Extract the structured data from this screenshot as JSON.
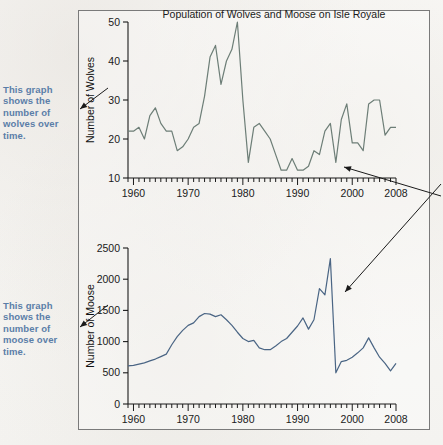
{
  "figure": {
    "title": "Population of Wolves and Moose on Isle Royale",
    "colors": {
      "wolves_line": "#6d7e77",
      "moose_line": "#4a6584",
      "callout_text": "#5b7ea8",
      "frame": "#7a7a7a",
      "axis": "#1a1a1a",
      "page_bg": "#f7f6f4"
    }
  },
  "callouts": {
    "wolves": "This graph shows the number of wolves over time.",
    "moose": "This graph shows the number of moose over time."
  },
  "chart_data": [
    {
      "type": "line",
      "id": "wolves",
      "title": "Population of Wolves and Moose on Isle Royale",
      "xlabel": "",
      "ylabel": "Number of Wolves",
      "xlim": [
        1959,
        2008
      ],
      "ylim": [
        10,
        50
      ],
      "ytick_values": [
        10,
        20,
        30,
        40,
        50
      ],
      "ytick_labels": [
        "10",
        "20",
        "30",
        "40",
        "50"
      ],
      "xtick_values": [
        1960,
        1970,
        1980,
        1990,
        2000,
        2008
      ],
      "xtick_labels": [
        "1960",
        "1970",
        "1980",
        "1990",
        "2000",
        "2008"
      ],
      "minor_xticks_every": 1,
      "grid": false,
      "legend": "none",
      "x": [
        1959,
        1960,
        1961,
        1962,
        1963,
        1964,
        1965,
        1966,
        1967,
        1968,
        1969,
        1970,
        1971,
        1972,
        1973,
        1974,
        1975,
        1976,
        1977,
        1978,
        1979,
        1980,
        1981,
        1982,
        1983,
        1984,
        1985,
        1986,
        1987,
        1988,
        1989,
        1990,
        1991,
        1992,
        1993,
        1994,
        1995,
        1996,
        1997,
        1998,
        1999,
        2000,
        2001,
        2002,
        2003,
        2004,
        2005,
        2006,
        2007,
        2008
      ],
      "values": [
        22,
        22,
        23,
        20,
        26,
        28,
        24,
        22,
        22,
        17,
        18,
        20,
        23,
        24,
        31,
        41,
        44,
        34,
        40,
        43,
        50,
        30,
        14,
        23,
        24,
        22,
        20,
        16,
        12,
        12,
        15,
        12,
        12,
        13,
        17,
        16,
        22,
        24,
        14,
        25,
        29,
        19,
        19,
        17,
        29,
        30,
        30,
        21,
        23,
        23
      ]
    },
    {
      "type": "line",
      "id": "moose",
      "title": "",
      "xlabel": "",
      "ylabel": "Number of Moose",
      "xlim": [
        1959,
        2008
      ],
      "ylim": [
        0,
        2500
      ],
      "ytick_values": [
        0,
        500,
        1000,
        1500,
        2000,
        2500
      ],
      "ytick_labels": [
        "0",
        "500",
        "1000",
        "1500",
        "2000",
        "2500"
      ],
      "xtick_values": [
        1960,
        1970,
        1980,
        1990,
        2000,
        2008
      ],
      "xtick_labels": [
        "1960",
        "1970",
        "1980",
        "1990",
        "2000",
        "2008"
      ],
      "minor_xticks_every": 1,
      "grid": false,
      "legend": "none",
      "x": [
        1959,
        1960,
        1961,
        1962,
        1963,
        1964,
        1965,
        1966,
        1967,
        1968,
        1969,
        1970,
        1971,
        1972,
        1973,
        1974,
        1975,
        1976,
        1977,
        1978,
        1979,
        1980,
        1981,
        1982,
        1983,
        1984,
        1985,
        1986,
        1987,
        1988,
        1989,
        1990,
        1991,
        1992,
        1993,
        1994,
        1995,
        1996,
        1997,
        1998,
        1999,
        2000,
        2001,
        2002,
        2003,
        2004,
        2005,
        2006,
        2007,
        2008
      ],
      "values": [
        610,
        620,
        640,
        660,
        690,
        720,
        760,
        800,
        950,
        1080,
        1180,
        1260,
        1300,
        1400,
        1450,
        1440,
        1400,
        1430,
        1350,
        1260,
        1150,
        1050,
        1000,
        1020,
        900,
        870,
        870,
        930,
        1000,
        1050,
        1150,
        1250,
        1380,
        1200,
        1350,
        1850,
        1750,
        2330,
        500,
        680,
        700,
        750,
        820,
        900,
        1060,
        900,
        750,
        650,
        530,
        650
      ]
    }
  ]
}
